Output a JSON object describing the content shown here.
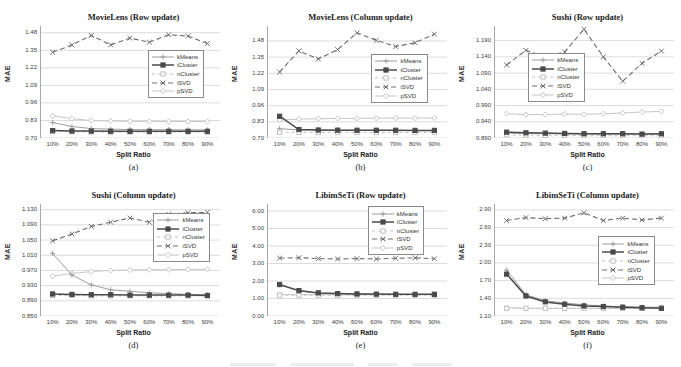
{
  "figure": {
    "ylabel": "MAE",
    "xlabel": "Split Ratio",
    "legend_entries": [
      "kMeans",
      "iCluster",
      "nCluster",
      "iSVD",
      "pSVD"
    ],
    "draw_order": [
      "pSVD",
      "kMeans",
      "iSVD",
      "nCluster",
      "iCluster"
    ],
    "colors": {
      "grid": "#dcdcdc",
      "axis": "#a8a8a8",
      "title_text": "#1c1c1c",
      "tick_text": "#3c3c3c",
      "legend_border": "#8a8a8a"
    }
  },
  "series_styles": {
    "kMeans": {
      "color": "#9e9e9e",
      "dash": "",
      "marker": "plus",
      "width": 1
    },
    "iCluster": {
      "color": "#4a4a4a",
      "dash": "",
      "marker": "square-filled",
      "width": 1.5
    },
    "nCluster": {
      "color": "#c2c2c2",
      "dash": "3 3",
      "marker": "square-open",
      "width": 1
    },
    "iSVD": {
      "color": "#6e6e6e",
      "dash": "5 3",
      "marker": "x",
      "width": 1.1
    },
    "pSVD": {
      "color": "#c6c6c6",
      "dash": "",
      "marker": "diamond-open",
      "width": 1
    }
  },
  "chart_data": [
    {
      "type": "line",
      "title": "MovieLens (Row update)",
      "caption": "(a)",
      "xlabel": "Split Ratio",
      "ylabel": "MAE",
      "grid": true,
      "categories": [
        "10%",
        "20%",
        "30%",
        "40%",
        "50%",
        "60%",
        "70%",
        "80%",
        "90%"
      ],
      "yticks": [
        "0.70",
        "0.83",
        "0.96",
        "1.09",
        "1.22",
        "1.35",
        "1.48"
      ],
      "ylim": [
        0.7,
        1.53
      ],
      "legend_pos": {
        "left_pct": 60,
        "top_pct": 21
      },
      "series": [
        {
          "name": "kMeans",
          "values": [
            0.815,
            0.785,
            0.77,
            0.765,
            0.763,
            0.762,
            0.761,
            0.76,
            0.76
          ]
        },
        {
          "name": "iCluster",
          "values": [
            0.755,
            0.752,
            0.751,
            0.75,
            0.75,
            0.75,
            0.75,
            0.75,
            0.75
          ]
        },
        {
          "name": "nCluster",
          "values": [
            0.748,
            0.746,
            0.745,
            0.744,
            0.744,
            0.744,
            0.744,
            0.744,
            0.744
          ]
        },
        {
          "name": "iSVD",
          "values": [
            1.335,
            1.39,
            1.46,
            1.39,
            1.44,
            1.41,
            1.465,
            1.455,
            1.4
          ]
        },
        {
          "name": "pSVD",
          "values": [
            0.865,
            0.843,
            0.83,
            0.826,
            0.824,
            0.823,
            0.822,
            0.822,
            0.822
          ]
        }
      ]
    },
    {
      "type": "line",
      "title": "MovieLens (Column update)",
      "caption": "(b)",
      "xlabel": "Split Ratio",
      "ylabel": "MAE",
      "grid": true,
      "categories": [
        "10%",
        "20%",
        "30%",
        "40%",
        "50%",
        "60%",
        "70%",
        "80%",
        "90%"
      ],
      "yticks": [
        "0.70",
        "0.83",
        "0.96",
        "1.09",
        "1.22",
        "1.35",
        "1.48"
      ],
      "ylim": [
        0.7,
        1.6
      ],
      "legend_pos": {
        "left_pct": 58,
        "top_pct": 25
      },
      "series": [
        {
          "name": "kMeans",
          "values": [
            0.775,
            0.765,
            0.763,
            0.762,
            0.762,
            0.761,
            0.761,
            0.761,
            0.761
          ]
        },
        {
          "name": "iCluster",
          "values": [
            0.875,
            0.768,
            0.764,
            0.763,
            0.762,
            0.762,
            0.762,
            0.761,
            0.761
          ]
        },
        {
          "name": "nCluster",
          "values": [
            0.746,
            0.745,
            0.744,
            0.744,
            0.744,
            0.744,
            0.744,
            0.744,
            0.744
          ]
        },
        {
          "name": "iSVD",
          "values": [
            1.23,
            1.4,
            1.335,
            1.41,
            1.545,
            1.485,
            1.435,
            1.465,
            1.535
          ]
        },
        {
          "name": "pSVD",
          "values": [
            0.845,
            0.852,
            0.855,
            0.857,
            0.858,
            0.859,
            0.86,
            0.86,
            0.861
          ]
        }
      ]
    },
    {
      "type": "line",
      "title": "Sushi (Row update)",
      "caption": "(c)",
      "xlabel": "Split Ratio",
      "ylabel": "MAE",
      "grid": true,
      "categories": [
        "10%",
        "20%",
        "30%",
        "40%",
        "50%",
        "60%",
        "70%",
        "80%",
        "90%"
      ],
      "yticks": [
        "0.890",
        "0.940",
        "0.990",
        "1.040",
        "1.090",
        "1.140",
        "1.190"
      ],
      "ylim": [
        0.89,
        1.235
      ],
      "legend_pos": {
        "left_pct": 19,
        "top_pct": 24
      },
      "series": [
        {
          "name": "kMeans",
          "values": [
            0.906,
            0.904,
            0.903,
            0.903,
            0.902,
            0.902,
            0.902,
            0.902,
            0.902
          ]
        },
        {
          "name": "iCluster",
          "values": [
            0.908,
            0.906,
            0.905,
            0.904,
            0.903,
            0.903,
            0.903,
            0.902,
            0.903
          ]
        },
        {
          "name": "nCluster",
          "values": [
            0.9,
            0.899,
            0.898,
            0.898,
            0.897,
            0.897,
            0.897,
            0.897,
            0.897
          ]
        },
        {
          "name": "iSVD",
          "values": [
            1.115,
            1.16,
            1.14,
            1.155,
            1.225,
            1.14,
            1.065,
            1.12,
            1.158
          ]
        },
        {
          "name": "pSVD",
          "values": [
            0.965,
            0.962,
            0.962,
            0.964,
            0.963,
            0.965,
            0.967,
            0.97,
            0.972
          ]
        }
      ]
    },
    {
      "type": "line",
      "title": "Sushi (Column update)",
      "caption": "(d)",
      "xlabel": "Split Ratio",
      "ylabel": "MAE",
      "grid": true,
      "categories": [
        "10%",
        "20%",
        "30%",
        "40%",
        "50%",
        "60%",
        "70%",
        "80%",
        "90%"
      ],
      "yticks": [
        "0.850",
        "0.890",
        "0.930",
        "0.970",
        "1.010",
        "1.050",
        "1.090",
        "1.130"
      ],
      "ylim": [
        0.85,
        1.145
      ],
      "legend_pos": {
        "left_pct": 63,
        "top_pct": 8
      },
      "series": [
        {
          "name": "kMeans",
          "values": [
            1.015,
            0.958,
            0.932,
            0.919,
            0.915,
            0.911,
            0.909,
            0.907,
            0.906
          ]
        },
        {
          "name": "iCluster",
          "values": [
            0.908,
            0.907,
            0.906,
            0.906,
            0.905,
            0.905,
            0.905,
            0.905,
            0.904
          ]
        },
        {
          "name": "nCluster",
          "values": [
            0.904,
            0.904,
            0.903,
            0.903,
            0.903,
            0.903,
            0.903,
            0.903,
            0.903
          ]
        },
        {
          "name": "iSVD",
          "values": [
            1.048,
            1.066,
            1.086,
            1.097,
            1.108,
            1.097,
            1.118,
            1.122,
            1.123
          ]
        },
        {
          "name": "pSVD",
          "values": [
            0.955,
            0.962,
            0.967,
            0.97,
            0.971,
            0.972,
            0.972,
            0.973,
            0.973
          ]
        }
      ]
    },
    {
      "type": "line",
      "title": "LibimSeTi (Row update)",
      "caption": "(e)",
      "xlabel": "Split Ratio",
      "ylabel": "MAE",
      "grid": true,
      "categories": [
        "10%",
        "20%",
        "30%",
        "40%",
        "50%",
        "60%",
        "70%",
        "80%",
        "90%"
      ],
      "yticks": [
        "0.00",
        "1.00",
        "2.00",
        "3.00",
        "4.00",
        "5.00",
        "6.00"
      ],
      "ylim": [
        0.0,
        6.4
      ],
      "legend_pos": {
        "left_pct": 56,
        "top_pct": 2
      },
      "series": [
        {
          "name": "kMeans",
          "values": [
            1.78,
            1.43,
            1.31,
            1.27,
            1.25,
            1.24,
            1.24,
            1.23,
            1.23
          ]
        },
        {
          "name": "iCluster",
          "values": [
            1.8,
            1.45,
            1.32,
            1.28,
            1.26,
            1.25,
            1.24,
            1.24,
            1.24
          ]
        },
        {
          "name": "nCluster",
          "values": [
            1.19,
            1.19,
            1.19,
            1.19,
            1.19,
            1.19,
            1.19,
            1.19,
            1.19
          ]
        },
        {
          "name": "iSVD",
          "values": [
            3.31,
            3.33,
            3.28,
            3.26,
            3.28,
            3.26,
            3.3,
            3.32,
            3.27
          ]
        },
        {
          "name": "pSVD",
          "values": [
            1.22,
            1.22,
            1.22,
            1.22,
            1.22,
            1.22,
            1.22,
            1.22,
            1.22
          ]
        }
      ]
    },
    {
      "type": "line",
      "title": "LibimSeTi (Column update)",
      "caption": "(f)",
      "xlabel": "Split Ratio",
      "ylabel": "MAE",
      "grid": true,
      "categories": [
        "10%",
        "20%",
        "30%",
        "40%",
        "50%",
        "60%",
        "70%",
        "80%",
        "90%"
      ],
      "yticks": [
        "1.10",
        "1.40",
        "1.70",
        "2.00",
        "2.30",
        "2.60",
        "2.90"
      ],
      "ylim": [
        1.1,
        3.0
      ],
      "legend_pos": {
        "left_pct": 58,
        "top_pct": 29
      },
      "series": [
        {
          "name": "kMeans",
          "values": [
            1.88,
            1.46,
            1.36,
            1.32,
            1.29,
            1.27,
            1.26,
            1.25,
            1.25
          ]
        },
        {
          "name": "iCluster",
          "values": [
            1.81,
            1.44,
            1.34,
            1.3,
            1.27,
            1.26,
            1.25,
            1.24,
            1.23
          ]
        },
        {
          "name": "nCluster",
          "values": [
            1.23,
            1.23,
            1.23,
            1.23,
            1.23,
            1.23,
            1.23,
            1.23,
            1.23
          ]
        },
        {
          "name": "iSVD",
          "values": [
            2.72,
            2.77,
            2.75,
            2.76,
            2.85,
            2.72,
            2.76,
            2.73,
            2.76
          ]
        },
        {
          "name": "pSVD",
          "values": [
            1.24,
            1.23,
            1.23,
            1.23,
            1.23,
            1.23,
            1.23,
            1.23,
            1.23
          ]
        }
      ]
    }
  ]
}
